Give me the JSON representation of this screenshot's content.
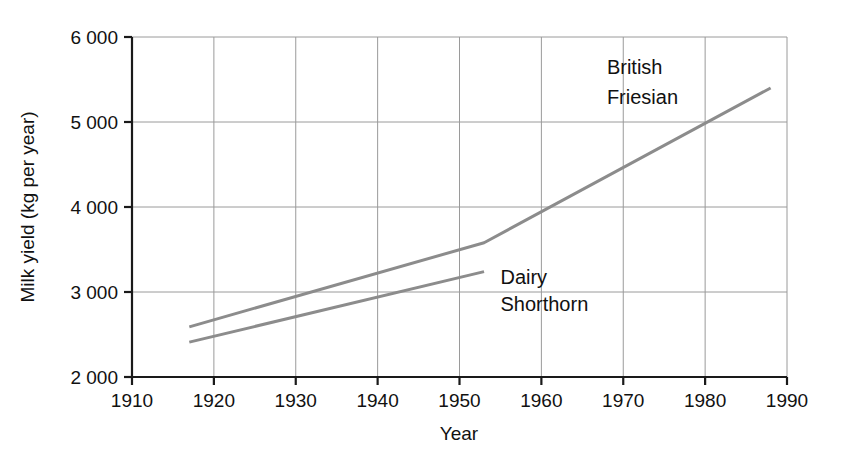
{
  "chart_data": {
    "type": "line",
    "title": "",
    "xlabel": "Year",
    "ylabel": "Milk yield (kg per year)",
    "xlim": [
      1910,
      1990
    ],
    "ylim": [
      2000,
      6000
    ],
    "grid": true,
    "legend_position": "inline-annotation",
    "x_ticks": [
      1910,
      1920,
      1930,
      1940,
      1950,
      1960,
      1970,
      1980,
      1990
    ],
    "x_tick_labels": [
      "1910",
      "1920",
      "1930",
      "1940",
      "1950",
      "1960",
      "1970",
      "1980",
      "1990"
    ],
    "y_ticks": [
      2000,
      3000,
      4000,
      5000,
      6000
    ],
    "y_tick_labels": [
      "2 000",
      "3 000",
      "4 000",
      "5 000",
      "6 000"
    ],
    "line_color": "#8c8c8c",
    "axis_color": "#1a1a1a",
    "grid_color": "#9a9a9a",
    "series": [
      {
        "name": "British Friesian",
        "label_lines": [
          "British",
          "Friesian"
        ],
        "points": [
          {
            "x": 1917,
            "y": 2590
          },
          {
            "x": 1953,
            "y": 3580
          },
          {
            "x": 1988,
            "y": 5400
          }
        ]
      },
      {
        "name": "Dairy Shorthorn",
        "label_lines": [
          "Dairy",
          "Shorthorn"
        ],
        "points": [
          {
            "x": 1917,
            "y": 2410
          },
          {
            "x": 1953,
            "y": 3240
          }
        ]
      }
    ],
    "annotations": [
      {
        "text": "British",
        "x": 1968,
        "y": 5650
      },
      {
        "text": "Friesian",
        "x": 1968,
        "y": 5300
      },
      {
        "text": "Dairy",
        "x": 1955,
        "y": 3180
      },
      {
        "text": "Shorthorn",
        "x": 1955,
        "y": 2860
      }
    ]
  }
}
